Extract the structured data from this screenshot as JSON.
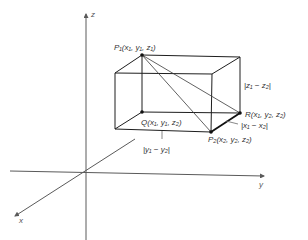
{
  "figure": {
    "type": "3d-distance-box-diagram",
    "axes": {
      "z_label": "z",
      "y_label": "y",
      "x_label": "x"
    },
    "points": {
      "P1": {
        "name": "P",
        "sub": "1",
        "coords": "(x₁, y₁, z₁)",
        "label": "P₁(x₁, y₁, z₁)"
      },
      "P2": {
        "name": "P",
        "sub": "2",
        "coords": "(x₂, y₂, z₂)",
        "label": "P₂(x₂, y₂, z₂)"
      },
      "Q": {
        "name": "Q",
        "coords": "(x₁, y₁, z₂)",
        "label": "Q(x₁, y₁, z₂)"
      },
      "R": {
        "name": "R",
        "coords": "(x₁, y₂, z₂)",
        "label": "R(x₁, y₂, z₂)"
      }
    },
    "dimensions": {
      "z_diff": "|z₁ − z₂|",
      "x_diff": "|x₁ − x₂|",
      "y_diff": "|y₁ − y₂|"
    },
    "colors": {
      "line": "#1e1e1e",
      "axis": "#5a5a5a",
      "text": "#333333",
      "background": "#ffffff"
    }
  }
}
